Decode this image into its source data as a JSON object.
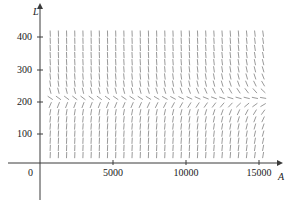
{
  "figure": {
    "kind": "slope-field",
    "background_color": "#ffffff",
    "segment_color": "#9a9a9a",
    "axis_color": "#3a3a3a"
  },
  "axes": {
    "x": {
      "name": "A",
      "name_x": 278,
      "name_y": 171,
      "min": 0,
      "max": 15900,
      "pixel_origin": 40,
      "pixel_per_unit": 0.01462,
      "baseline_y": 163,
      "arrow_tip_x": 277,
      "ticks": [
        {
          "value": 5000,
          "label": "5000",
          "px": 113
        },
        {
          "value": 10000,
          "label": "10000",
          "px": 186
        },
        {
          "value": 15000,
          "label": "15000",
          "px": 259
        }
      ],
      "tick_label_y": 167
    },
    "y": {
      "name": "L",
      "name_x": 33,
      "name_y": 6,
      "min": 0,
      "max": 440,
      "pixel_origin": 163,
      "pixel_per_unit": 0.3175,
      "baseline_x": 40,
      "arrow_tip_y": 9,
      "stub_bottom_y": 200,
      "ticks": [
        {
          "value": 100,
          "label": "100",
          "px": 134
        },
        {
          "value": 200,
          "label": "200",
          "px": 102
        },
        {
          "value": 300,
          "label": "300",
          "px": 70
        },
        {
          "value": 400,
          "label": "400",
          "px": 37
        }
      ],
      "tick_label_x": 32
    },
    "origin_label": {
      "label": "0",
      "x": 33,
      "y": 167
    }
  },
  "chart_data": {
    "type": "line",
    "title": "",
    "xlabel": "A",
    "ylabel": "L",
    "xlim": [
      0,
      15900
    ],
    "ylim": [
      0,
      440
    ],
    "grid": false,
    "legend": "none",
    "field": {
      "x_start": 700,
      "x_step": 560,
      "x_count": 27,
      "y_start": 25,
      "y_step": 22.5,
      "y_count": 18,
      "segment_length_px": 6.2,
      "model": {
        "equilibrium_L": 200,
        "growth_scale": 0.0105,
        "saturation_A": 2300,
        "decay_A": 17000
      }
    },
    "nullcline": {
      "L": 200,
      "style": "implied-horizontal-segments"
    }
  }
}
